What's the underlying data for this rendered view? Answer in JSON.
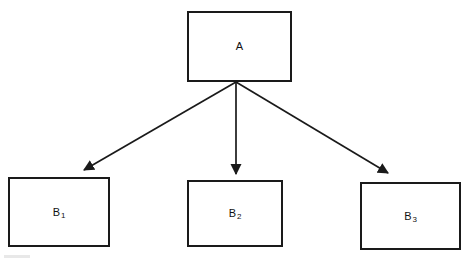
{
  "diagram": {
    "type": "tree",
    "title": "",
    "background_color": "#ffffff",
    "stroke_color": "#1a1a1a",
    "canvas": {
      "width": 471,
      "height": 266
    },
    "nodes": [
      {
        "id": "A",
        "label_main": "A",
        "label_sub": "",
        "role": "root",
        "x": 187,
        "y": 11,
        "width": 105,
        "height": 71
      },
      {
        "id": "B1",
        "label_main": "B",
        "label_sub": "1",
        "role": "child",
        "x": 8,
        "y": 177,
        "width": 102,
        "height": 70
      },
      {
        "id": "B2",
        "label_main": "B",
        "label_sub": "2",
        "role": "child",
        "x": 187,
        "y": 180,
        "width": 96,
        "height": 67
      },
      {
        "id": "B3",
        "label_main": "B",
        "label_sub": "3",
        "role": "child",
        "x": 360,
        "y": 182,
        "width": 101,
        "height": 68
      }
    ],
    "edges": [
      {
        "id": "edge-a-b1",
        "from": "A",
        "to": "B1",
        "label": "",
        "arrowhead": "filled-triangle",
        "x1": 236,
        "y1": 82,
        "x2": 84,
        "y2": 172
      },
      {
        "id": "edge-a-b2",
        "from": "A",
        "to": "B2",
        "label": "",
        "arrowhead": "filled-triangle",
        "x1": 236,
        "y1": 82,
        "x2": 236,
        "y2": 176
      },
      {
        "id": "edge-a-b3",
        "from": "A",
        "to": "B3",
        "label": "",
        "arrowhead": "filled-triangle",
        "x1": 236,
        "y1": 82,
        "x2": 389,
        "y2": 175
      }
    ]
  }
}
